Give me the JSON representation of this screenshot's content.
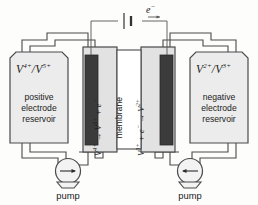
{
  "diagram": {
    "colors": {
      "stroke": "#3a3a3a",
      "electrode_fill": "#3b3b3b",
      "reservoir_fill": "#ececec",
      "cell_fill": "#e2e2e2",
      "membrane_fill": "#ffffff",
      "pipe_fill": "#e6e6e6",
      "text": "#1b1b1b",
      "background": "#fdfdfc"
    },
    "left_reservoir": {
      "ion_label": "V",
      "ion_sup_a": "4+",
      "ion_separator": "/",
      "ion_sup_b": "5+",
      "name_line1": "positive",
      "name_line2": "electrode",
      "name_line3": "reservoir"
    },
    "right_reservoir": {
      "ion_label": "V",
      "ion_sup_a": "2+",
      "ion_separator": "/",
      "ion_sup_b": "3+",
      "name_line1": "negative",
      "name_line2": "electrode",
      "name_line3": "reservoir"
    },
    "left_reaction": {
      "species_1": "V",
      "sup_1": "4+",
      "arrow": "→",
      "species_2": "V",
      "sup_2": "5+",
      "plus": "+",
      "electron": "e",
      "electron_sup": "−"
    },
    "right_reaction": {
      "species_1": "V",
      "sup_1": "3+",
      "plus": "+",
      "electron": "e",
      "electron_sup": "−",
      "arrow": "→",
      "species_2": "V",
      "sup_2": "2+"
    },
    "membrane": {
      "label": "membrane"
    },
    "circuit": {
      "electron_label": "e",
      "electron_sup": "−",
      "source_name": "battery-cell-symbol"
    },
    "left_pump": {
      "label": "pump",
      "direction": "right"
    },
    "right_pump": {
      "label": "pump",
      "direction": "left"
    }
  }
}
